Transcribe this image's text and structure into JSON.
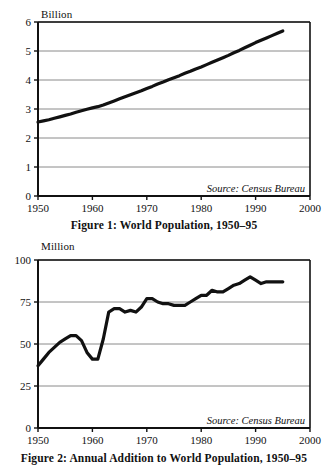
{
  "page": {
    "background": "#ffffff",
    "ink": "#111111",
    "gridline_color": "#8a8a8a"
  },
  "figure1": {
    "unit_label": "Billion",
    "source_note": "Source: Census Bureau",
    "caption": "Figure 1: World Population, 1950–95"
  },
  "figure2": {
    "unit_label": "Million",
    "source_note": "Source: Census Bureau",
    "caption": "Figure 2: Annual Addition to World Population, 1950–95"
  },
  "chart_data": [
    {
      "type": "line",
      "id": "figure-1",
      "title": "Figure 1: World Population, 1950–95",
      "xlabel": "",
      "ylabel": "Billion",
      "unit": "Billion",
      "annotation": "Source: Census Bureau",
      "grid": true,
      "grid_axis": "y",
      "legend": "none",
      "xlim": [
        1950,
        2000
      ],
      "ylim": [
        0,
        6
      ],
      "xticks": [
        1950,
        1960,
        1970,
        1980,
        1990,
        2000
      ],
      "yticks": [
        0,
        1,
        2,
        3,
        4,
        5,
        6
      ],
      "x": [
        1950,
        1951,
        1952,
        1953,
        1954,
        1955,
        1956,
        1957,
        1958,
        1959,
        1960,
        1961,
        1962,
        1963,
        1964,
        1965,
        1966,
        1967,
        1968,
        1969,
        1970,
        1971,
        1972,
        1973,
        1974,
        1975,
        1976,
        1977,
        1978,
        1979,
        1980,
        1981,
        1982,
        1983,
        1984,
        1985,
        1986,
        1987,
        1988,
        1989,
        1990,
        1991,
        1992,
        1993,
        1994,
        1995
      ],
      "values": [
        2.55,
        2.59,
        2.63,
        2.68,
        2.73,
        2.78,
        2.83,
        2.89,
        2.94,
        2.99,
        3.04,
        3.08,
        3.14,
        3.21,
        3.28,
        3.35,
        3.42,
        3.49,
        3.56,
        3.63,
        3.71,
        3.78,
        3.86,
        3.93,
        4.01,
        4.08,
        4.15,
        4.23,
        4.3,
        4.38,
        4.45,
        4.53,
        4.61,
        4.69,
        4.77,
        4.85,
        4.94,
        5.02,
        5.11,
        5.2,
        5.29,
        5.37,
        5.45,
        5.53,
        5.61,
        5.69
      ]
    },
    {
      "type": "line",
      "id": "figure-2",
      "title": "Figure 2: Annual Addition to World Population, 1950–95",
      "xlabel": "",
      "ylabel": "Million",
      "unit": "Million",
      "annotation": "Source: Census Bureau",
      "grid": true,
      "grid_axis": "y",
      "legend": "none",
      "xlim": [
        1950,
        2000
      ],
      "ylim": [
        0,
        100
      ],
      "xticks": [
        1950,
        1960,
        1970,
        1980,
        1990,
        2000
      ],
      "yticks": [
        0,
        25,
        50,
        75,
        100
      ],
      "x": [
        1950,
        1951,
        1952,
        1953,
        1954,
        1955,
        1956,
        1957,
        1958,
        1959,
        1960,
        1961,
        1962,
        1963,
        1964,
        1965,
        1966,
        1967,
        1968,
        1969,
        1970,
        1971,
        1972,
        1973,
        1974,
        1975,
        1976,
        1977,
        1978,
        1979,
        1980,
        1981,
        1982,
        1983,
        1984,
        1985,
        1986,
        1987,
        1988,
        1989,
        1990,
        1991,
        1992,
        1993,
        1994,
        1995
      ],
      "values": [
        37,
        41,
        45,
        48,
        51,
        53,
        55,
        55,
        52,
        45,
        41,
        41,
        53,
        69,
        71,
        71,
        69,
        70,
        69,
        72,
        77,
        77,
        75,
        74,
        74,
        73,
        73,
        73,
        75,
        77,
        79,
        79,
        82,
        81,
        81,
        83,
        85,
        86,
        88,
        90,
        88,
        86,
        87,
        87,
        87,
        87
      ]
    }
  ]
}
